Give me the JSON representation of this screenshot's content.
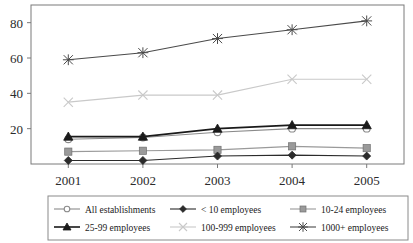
{
  "chart_data": {
    "type": "line",
    "title": "",
    "xlabel": "",
    "ylabel": "",
    "categories": [
      "2001",
      "2002",
      "2003",
      "2004",
      "2005"
    ],
    "x": [
      2001,
      2002,
      2003,
      2004,
      2005
    ],
    "ylim": [
      0,
      90
    ],
    "yticks": [
      20,
      40,
      60,
      80
    ],
    "ytick_labels": [
      "20",
      "40",
      "60",
      "80"
    ],
    "grid": false,
    "legend_position": "bottom",
    "series": [
      {
        "name": "All establishments",
        "values": [
          14,
          15,
          18,
          20,
          20
        ],
        "marker": "open-circle",
        "color": "#8a8a8a",
        "line_width": 1.1
      },
      {
        "name": "< 10 employees",
        "values": [
          2,
          2,
          4.5,
          5,
          4.5
        ],
        "marker": "filled-diamond",
        "color": "#2b2b2b",
        "line_width": 1.1
      },
      {
        "name": "10-24 employees",
        "values": [
          7,
          7.5,
          8,
          10,
          9
        ],
        "marker": "filled-square",
        "color": "#9a9a9a",
        "line_width": 1.1
      },
      {
        "name": "25-99 employees",
        "values": [
          15.5,
          15.5,
          20,
          22,
          22
        ],
        "marker": "filled-triangle",
        "color": "#1a1a1a",
        "line_width": 1.6
      },
      {
        "name": "100-999 employees",
        "values": [
          35,
          39,
          39,
          48,
          48
        ],
        "marker": "cross-x",
        "color": "#c9c9c9",
        "line_width": 1.1
      },
      {
        "name": "1000+ employees",
        "values": [
          59,
          63,
          71,
          76,
          81
        ],
        "marker": "star-x",
        "color": "#4a4a4a",
        "line_width": 1.1
      }
    ]
  },
  "legend": {
    "rows": [
      [
        "All establishments",
        "< 10 employees",
        "10-24 employees"
      ],
      [
        "25-99 employees",
        "100-999 employees",
        "1000+ employees"
      ]
    ],
    "border_color": "#8a8a8a"
  },
  "axes": {
    "frame_color": "#7a7a7a",
    "tick_color": "#7a7a7a"
  }
}
